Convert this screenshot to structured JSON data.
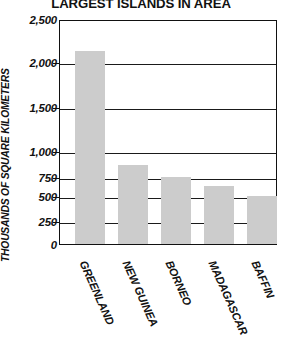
{
  "chart_data": {
    "type": "bar",
    "title": "LARGEST ISLANDS IN AREA",
    "xlabel": "",
    "ylabel": "THOUSANDS OF SQUARE KILOMETERS",
    "categories": [
      "GREENLAND",
      "NEW GUINEA",
      "BORNEO",
      "MADAGASCAR",
      "BAFFIN"
    ],
    "values": [
      2130,
      810,
      750,
      620,
      500
    ],
    "ylim": [
      0,
      2500
    ],
    "grid": true,
    "legend": "none",
    "axis_note": "non-linear y-axis: equal pixel bands between 250-increments up to 1,000, then 500-increments",
    "y_ticks": [
      {
        "label": "2,500",
        "value": 2500,
        "y": 20
      },
      {
        "label": "2,000",
        "value": 2000,
        "y": 63
      },
      {
        "label": "1,500",
        "value": 1500,
        "y": 108
      },
      {
        "label": "1,000",
        "value": 1000,
        "y": 152
      },
      {
        "label": "750",
        "value": 750,
        "y": 178
      },
      {
        "label": "500",
        "value": 500,
        "y": 197
      },
      {
        "label": "250",
        "value": 250,
        "y": 222
      },
      {
        "label": "0",
        "value": 0,
        "y": 245
      }
    ],
    "bars": [
      {
        "name": "GREENLAND",
        "value": 2130,
        "left": 15,
        "width": 30,
        "top": 52
      },
      {
        "name": "NEW GUINEA",
        "value": 810,
        "left": 58,
        "width": 30,
        "top": 166
      },
      {
        "name": "BORNEO",
        "value": 750,
        "left": 101,
        "width": 30,
        "top": 178
      },
      {
        "name": "MADAGASCAR",
        "value": 620,
        "left": 144,
        "width": 30,
        "top": 187
      },
      {
        "name": "BAFFIN",
        "value": 500,
        "left": 187,
        "width": 30,
        "top": 197
      }
    ],
    "colors": {
      "bar_fill": "#cccccc",
      "axis": "#111111",
      "grid": "#1a1a1a",
      "text": "#111111",
      "background": "#ffffff"
    }
  }
}
